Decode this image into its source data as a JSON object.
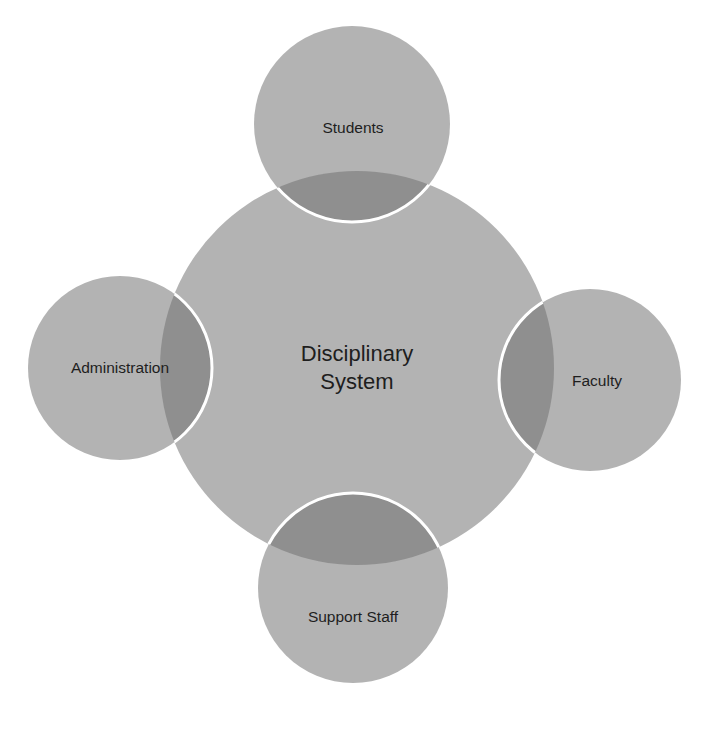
{
  "diagram": {
    "type": "hub-and-spoke venn",
    "center": {
      "label_line1": "Disciplinary",
      "label_line2": "System",
      "cx": 357,
      "cy": 368,
      "r": 197
    },
    "satellites": [
      {
        "id": "students",
        "label": "Students",
        "cx": 352,
        "cy": 124,
        "r": 98
      },
      {
        "id": "administration",
        "label": "Administration",
        "cx": 120,
        "cy": 368,
        "r": 92
      },
      {
        "id": "faculty",
        "label": "Faculty",
        "cx": 590,
        "cy": 380,
        "r": 91
      },
      {
        "id": "support-staff",
        "label": "Support Staff",
        "cx": 353,
        "cy": 588,
        "r": 95
      }
    ],
    "colors": {
      "fill": "#b3b3b3",
      "overlap": "#8f8f8f",
      "outline": "#ffffff",
      "text": "#1e1e1e"
    }
  }
}
